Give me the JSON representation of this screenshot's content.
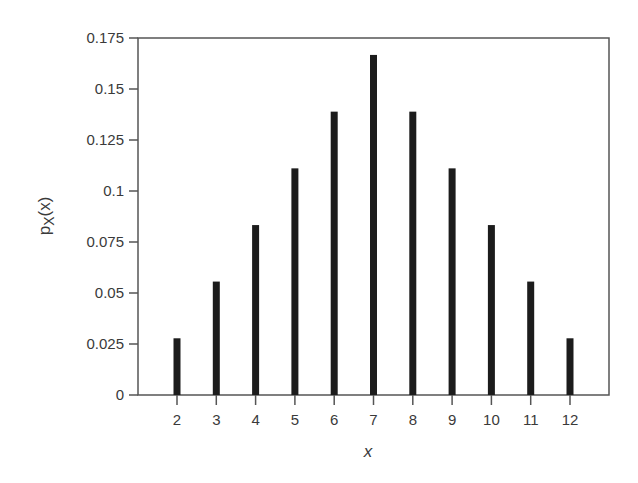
{
  "chart_data": {
    "type": "bar",
    "title": "",
    "xlabel": "x",
    "ylabel": "pX(x)",
    "ylabel_parts": {
      "main": "p",
      "sub": "X",
      "tail": "(x)"
    },
    "categories": [
      "2",
      "3",
      "4",
      "5",
      "6",
      "7",
      "8",
      "9",
      "10",
      "11",
      "12"
    ],
    "values": [
      0.0278,
      0.0556,
      0.0833,
      0.1111,
      0.1389,
      0.1667,
      0.1389,
      0.1111,
      0.0833,
      0.0556,
      0.0278
    ],
    "ylim": [
      0,
      0.175
    ],
    "yticks": [
      0,
      0.025,
      0.05,
      0.075,
      0.1,
      0.125,
      0.15,
      0.175
    ],
    "ytick_labels": [
      "0",
      "0.025",
      "0.05",
      "0.075",
      "0.1",
      "0.125",
      "0.15",
      "0.175"
    ],
    "grid": false,
    "legend": null,
    "colors": {
      "bar": "#1c1c1c",
      "axis": "#555555",
      "text": "#3a3a3a"
    }
  }
}
